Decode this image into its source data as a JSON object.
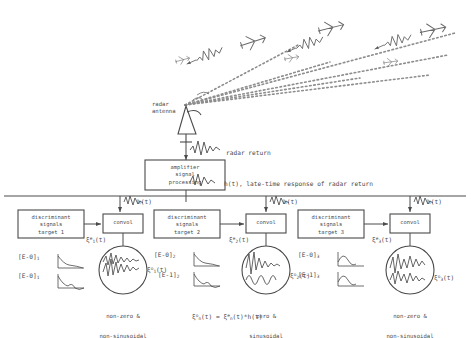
{
  "figure": {
    "ink_color": "#4a4a4a",
    "background": "#ffffff"
  },
  "antenna": {
    "label": "radar\nantenna",
    "icon": "antenna-icon"
  },
  "scene": {
    "targets": [
      {
        "name": "aircraft-1",
        "label": ""
      },
      {
        "name": "aircraft-2",
        "label": ""
      },
      {
        "name": "aircraft-3",
        "label": ""
      }
    ],
    "beam_style": "dashed"
  },
  "signals": {
    "radar_return": "radar return",
    "late_time": "h(t), late-time response of radar return",
    "bus_tap": "h(t)"
  },
  "processor": {
    "label": "amplifier\nsignal\nprocessing",
    "line1": "amplifier",
    "line2": "signal",
    "line3": "processing"
  },
  "convolver_label": "convol",
  "channels": [
    {
      "index": 1,
      "box": {
        "line1": "discriminant",
        "line2": "signals",
        "line3": "target 1"
      },
      "input_signal": "ξ",
      "input_sub": "1",
      "input_sup": "e",
      "input_arg": "(t)",
      "output_sub": "1",
      "output_sup": "o",
      "output_arg": "(t)",
      "discriminants": [
        "[E-0]",
        "[E-0]"
      ],
      "discriminant_subs": [
        "1",
        "1"
      ],
      "character_line1": "non-zero &",
      "character_line2": "non-sinusoidal"
    },
    {
      "index": 2,
      "box": {
        "line1": "discriminant",
        "line2": "signals",
        "line3": "target 2"
      },
      "input_signal": "ξ",
      "input_sub": "2",
      "input_sup": "e",
      "input_arg": "(t)",
      "output_sub": "2",
      "output_sup": "o",
      "output_arg": "(t)",
      "discriminants": [
        "[E-0]",
        "[E-1]"
      ],
      "discriminant_subs": [
        "2",
        "2"
      ],
      "character_line1": "zero &",
      "character_line2": "sinusoidal"
    },
    {
      "index": 3,
      "box": {
        "line1": "discriminant",
        "line2": "signals",
        "line3": "target 3"
      },
      "input_signal": "ξ",
      "input_sub": "3",
      "input_sup": "e",
      "input_arg": "(t)",
      "output_sub": "3",
      "output_sup": "o",
      "output_arg": "(t)",
      "discriminants": [
        "[E-0]",
        "[E-1]"
      ],
      "discriminant_subs": [
        "3",
        "3"
      ],
      "character_line1": "non-zero &",
      "character_line2": "non-sinusoidal"
    }
  ],
  "equation": {
    "lhs_symbol": "ξ",
    "lhs_sub": "n",
    "lhs_sup": "o",
    "lhs_arg": "(t)",
    "eq": " = ",
    "rhs_symbol": "ξ",
    "rhs_sub": "n",
    "rhs_sup": "e",
    "rhs_arg": "(t)*h(t)"
  }
}
